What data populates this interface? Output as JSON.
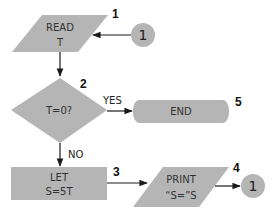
{
  "flowchart": {
    "steps": [
      {
        "id": "read",
        "number": "1",
        "shape": "parallelogram",
        "lines": [
          "READ",
          "T"
        ]
      },
      {
        "id": "decision",
        "number": "2",
        "shape": "diamond",
        "lines": [
          "T=0?"
        ]
      },
      {
        "id": "let",
        "number": "3",
        "shape": "rectangle",
        "lines": [
          "LET",
          "S=5T"
        ]
      },
      {
        "id": "print",
        "number": "4",
        "shape": "parallelogram",
        "lines": [
          "PRINT",
          "“S=”S"
        ]
      },
      {
        "id": "end",
        "number": "5",
        "shape": "terminal",
        "lines": [
          "END"
        ]
      }
    ],
    "branches": {
      "yes": "YES",
      "no": "NO"
    },
    "connectors": [
      {
        "id": "connector-in",
        "label": "1"
      },
      {
        "id": "connector-out",
        "label": "1"
      }
    ],
    "colors": {
      "shape_fill": "#b5b5b5",
      "line": "#1a1a1a"
    }
  }
}
